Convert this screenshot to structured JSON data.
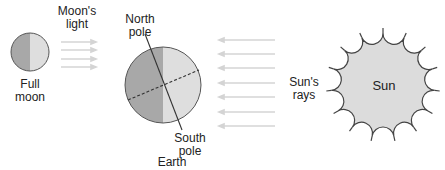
{
  "diagram": {
    "moon": {
      "label_line1": "Full",
      "label_line2": "moon",
      "dark_color": "#a8a8a8",
      "light_color": "#dedede"
    },
    "moon_light": {
      "label_line1": "Moon's",
      "label_line2": "light",
      "arrow_count": 4
    },
    "earth": {
      "label": "Earth",
      "north_label_line1": "North",
      "north_label_line2": "pole",
      "south_label_line1": "South",
      "south_label_line2": "pole",
      "dark_color": "#a8a8a8",
      "light_color": "#dedede"
    },
    "sun_rays": {
      "label_line1": "Sun's",
      "label_line2": "rays",
      "arrow_count": 7
    },
    "sun": {
      "label": "Sun",
      "fill_color": "#dcdcdc"
    }
  }
}
